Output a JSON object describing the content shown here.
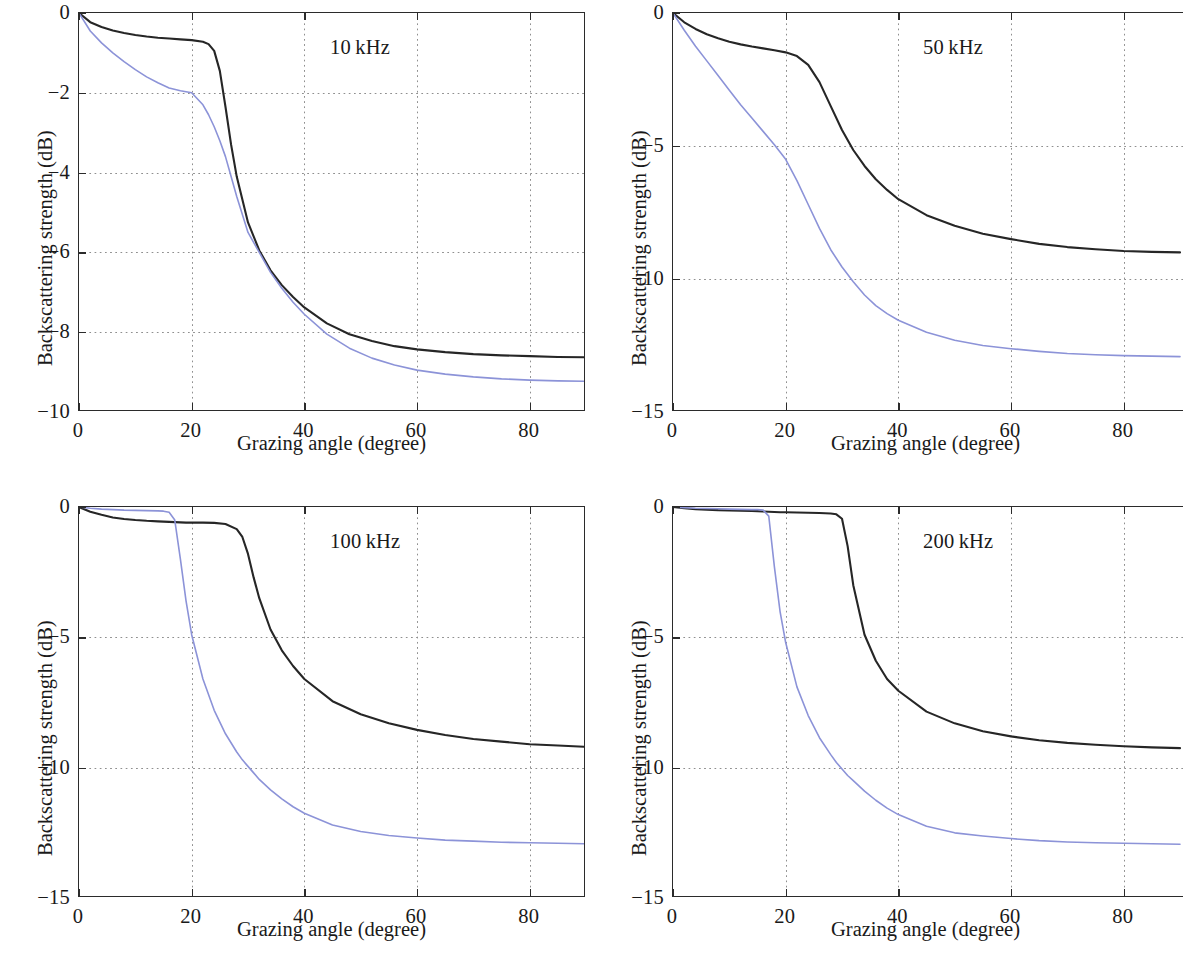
{
  "figure": {
    "layout": "2x2 grid of line plots",
    "background_color": "#ffffff",
    "axis_color": "#2b2b2b",
    "grid_color": "#8f8f8f"
  },
  "axis_titles": {
    "x": "Grazing angle (degree)",
    "y": "Backscattering strength (dB)"
  },
  "series_colors": {
    "black_curve": "#262626",
    "blue_curve": "#8c93d8"
  },
  "chart_data": [
    {
      "type": "line",
      "title": "10 kHz",
      "xlabel": "Grazing angle (degree)",
      "ylabel": "Backscattering strength (dB)",
      "xlim": [
        0,
        90
      ],
      "ylim": [
        -10,
        0
      ],
      "xticks": [
        0,
        20,
        40,
        60,
        80
      ],
      "yticks": [
        0,
        -2,
        -4,
        -6,
        -8,
        -10
      ],
      "xtick_labels": [
        "0",
        "20",
        "40",
        "60",
        "80"
      ],
      "ytick_labels": [
        "0",
        "−2",
        "−4",
        "−6",
        "−8",
        "−10"
      ],
      "grid": true,
      "legend": "none",
      "x": [
        0,
        2,
        4,
        6,
        8,
        10,
        12,
        14,
        16,
        18,
        20,
        22,
        23,
        24,
        25,
        26,
        27,
        28,
        30,
        32,
        34,
        36,
        38,
        40,
        44,
        48,
        52,
        56,
        60,
        65,
        70,
        75,
        80,
        85,
        90
      ],
      "series": [
        {
          "name": "black_curve",
          "color": "#262626",
          "values": [
            0,
            -0.23,
            -0.35,
            -0.44,
            -0.5,
            -0.55,
            -0.59,
            -0.62,
            -0.64,
            -0.66,
            -0.68,
            -0.72,
            -0.78,
            -0.95,
            -1.45,
            -2.35,
            -3.3,
            -4.1,
            -5.25,
            -5.95,
            -6.45,
            -6.82,
            -7.12,
            -7.38,
            -7.78,
            -8.05,
            -8.22,
            -8.35,
            -8.43,
            -8.5,
            -8.55,
            -8.58,
            -8.6,
            -8.62,
            -8.63
          ]
        },
        {
          "name": "blue_curve",
          "color": "#8c93d8",
          "values": [
            0,
            -0.45,
            -0.75,
            -1.0,
            -1.22,
            -1.42,
            -1.6,
            -1.75,
            -1.88,
            -1.95,
            -2.0,
            -2.3,
            -2.55,
            -2.85,
            -3.2,
            -3.6,
            -4.1,
            -4.6,
            -5.5,
            -6.0,
            -6.5,
            -6.9,
            -7.25,
            -7.55,
            -8.05,
            -8.4,
            -8.65,
            -8.82,
            -8.95,
            -9.05,
            -9.12,
            -9.17,
            -9.2,
            -9.22,
            -9.23
          ]
        }
      ]
    },
    {
      "type": "line",
      "title": "50 kHz",
      "xlabel": "Grazing angle (degree)",
      "ylabel": "Backscattering strength (dB)",
      "xlim": [
        0,
        90
      ],
      "ylim": [
        -15,
        0
      ],
      "xticks": [
        0,
        20,
        40,
        60,
        80
      ],
      "yticks": [
        0,
        -5,
        -10,
        -15
      ],
      "xtick_labels": [
        "0",
        "20",
        "40",
        "60",
        "80"
      ],
      "ytick_labels": [
        "0",
        "−5",
        "−10",
        "−15"
      ],
      "grid": true,
      "legend": "none",
      "x": [
        0,
        2,
        4,
        6,
        8,
        10,
        12,
        14,
        16,
        18,
        20,
        22,
        24,
        26,
        28,
        30,
        32,
        34,
        36,
        38,
        40,
        45,
        50,
        55,
        60,
        65,
        70,
        75,
        80,
        85,
        90
      ],
      "series": [
        {
          "name": "black_curve",
          "color": "#262626",
          "values": [
            0,
            -0.35,
            -0.6,
            -0.8,
            -0.95,
            -1.08,
            -1.18,
            -1.26,
            -1.33,
            -1.4,
            -1.48,
            -1.62,
            -1.95,
            -2.6,
            -3.5,
            -4.4,
            -5.15,
            -5.75,
            -6.25,
            -6.65,
            -7.0,
            -7.6,
            -8.0,
            -8.3,
            -8.5,
            -8.68,
            -8.8,
            -8.88,
            -8.95,
            -8.98,
            -9.0
          ]
        },
        {
          "name": "blue_curve",
          "color": "#8c93d8",
          "values": [
            0,
            -0.65,
            -1.25,
            -1.8,
            -2.35,
            -2.9,
            -3.45,
            -3.95,
            -4.45,
            -4.95,
            -5.5,
            -6.3,
            -7.2,
            -8.1,
            -8.9,
            -9.55,
            -10.1,
            -10.6,
            -11.0,
            -11.3,
            -11.55,
            -12.0,
            -12.3,
            -12.5,
            -12.62,
            -12.72,
            -12.8,
            -12.85,
            -12.88,
            -12.9,
            -12.92
          ]
        }
      ]
    },
    {
      "type": "line",
      "title": "100 kHz",
      "xlabel": "Grazing angle (degree)",
      "ylabel": "Backscattering strength (dB)",
      "xlim": [
        0,
        90
      ],
      "ylim": [
        -15,
        0
      ],
      "xticks": [
        0,
        20,
        40,
        60,
        80
      ],
      "yticks": [
        0,
        -5,
        -10,
        -15
      ],
      "xtick_labels": [
        "0",
        "20",
        "40",
        "60",
        "80"
      ],
      "ytick_labels": [
        "0",
        "−5",
        "−10",
        "−15"
      ],
      "grid": true,
      "legend": "none",
      "x": [
        0,
        2,
        4,
        6,
        8,
        10,
        12,
        14,
        15,
        16,
        17,
        18,
        19,
        20,
        22,
        24,
        26,
        28,
        29,
        30,
        31,
        32,
        34,
        36,
        38,
        40,
        45,
        50,
        55,
        60,
        65,
        70,
        75,
        80,
        85,
        90
      ],
      "series": [
        {
          "name": "black_curve",
          "color": "#262626",
          "values": [
            0,
            -0.18,
            -0.3,
            -0.4,
            -0.46,
            -0.5,
            -0.53,
            -0.55,
            -0.56,
            -0.57,
            -0.58,
            -0.59,
            -0.6,
            -0.6,
            -0.6,
            -0.61,
            -0.65,
            -0.85,
            -1.15,
            -1.8,
            -2.7,
            -3.5,
            -4.7,
            -5.5,
            -6.1,
            -6.6,
            -7.45,
            -7.95,
            -8.3,
            -8.55,
            -8.75,
            -8.9,
            -9.0,
            -9.1,
            -9.15,
            -9.2
          ]
        },
        {
          "name": "blue_curve",
          "color": "#8c93d8",
          "values": [
            0,
            -0.05,
            -0.08,
            -0.1,
            -0.12,
            -0.13,
            -0.14,
            -0.15,
            -0.16,
            -0.2,
            -0.5,
            -2.0,
            -3.6,
            -4.9,
            -6.6,
            -7.8,
            -8.7,
            -9.4,
            -9.7,
            -9.95,
            -10.2,
            -10.45,
            -10.85,
            -11.2,
            -11.5,
            -11.75,
            -12.2,
            -12.45,
            -12.6,
            -12.7,
            -12.78,
            -12.82,
            -12.86,
            -12.88,
            -12.9,
            -12.92
          ]
        }
      ]
    },
    {
      "type": "line",
      "title": "200 kHz",
      "xlabel": "Grazing angle (degree)",
      "ylabel": "Backscattering strength (dB)",
      "xlim": [
        0,
        90
      ],
      "ylim": [
        -15,
        0
      ],
      "xticks": [
        0,
        20,
        40,
        60,
        80
      ],
      "yticks": [
        0,
        -5,
        -10,
        -15
      ],
      "xtick_labels": [
        "0",
        "20",
        "40",
        "60",
        "80"
      ],
      "ytick_labels": [
        "0",
        "−5",
        "−10",
        "−15"
      ],
      "grid": true,
      "legend": "none",
      "x": [
        0,
        2,
        4,
        6,
        8,
        10,
        12,
        14,
        15,
        16,
        17,
        18,
        19,
        20,
        22,
        24,
        26,
        28,
        29,
        30,
        31,
        32,
        34,
        36,
        38,
        40,
        45,
        50,
        55,
        60,
        65,
        70,
        75,
        80,
        85,
        90
      ],
      "series": [
        {
          "name": "black_curve",
          "color": "#262626",
          "values": [
            0,
            -0.05,
            -0.08,
            -0.1,
            -0.12,
            -0.13,
            -0.14,
            -0.15,
            -0.16,
            -0.17,
            -0.18,
            -0.19,
            -0.2,
            -0.2,
            -0.21,
            -0.22,
            -0.23,
            -0.25,
            -0.28,
            -0.45,
            -1.5,
            -3.0,
            -4.9,
            -5.9,
            -6.6,
            -7.05,
            -7.85,
            -8.3,
            -8.6,
            -8.8,
            -8.95,
            -9.05,
            -9.12,
            -9.18,
            -9.22,
            -9.25
          ]
        },
        {
          "name": "blue_curve",
          "color": "#8c93d8",
          "values": [
            0,
            -0.03,
            -0.05,
            -0.06,
            -0.07,
            -0.08,
            -0.09,
            -0.1,
            -0.1,
            -0.12,
            -0.35,
            -2.3,
            -4.0,
            -5.2,
            -6.9,
            -8.0,
            -8.85,
            -9.5,
            -9.8,
            -10.05,
            -10.3,
            -10.5,
            -10.9,
            -11.25,
            -11.55,
            -11.8,
            -12.25,
            -12.5,
            -12.62,
            -12.72,
            -12.8,
            -12.85,
            -12.88,
            -12.9,
            -12.92,
            -12.94
          ]
        }
      ]
    }
  ]
}
